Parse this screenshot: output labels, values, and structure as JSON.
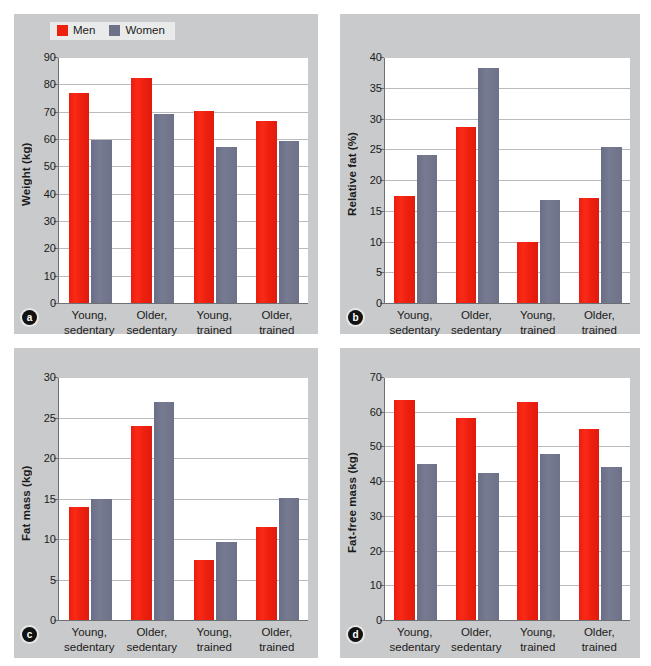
{
  "figure": {
    "background": "#ffffff",
    "panel_background": "#c9cacb",
    "plot_background": "#ffffff"
  },
  "legend": {
    "entries": [
      {
        "label": "Men",
        "color": "#ee2010",
        "swatch_name": "men-color-swatch"
      },
      {
        "label": "Women",
        "color": "#6d7289",
        "swatch_name": "women-color-swatch"
      }
    ]
  },
  "categories": [
    "Young,\nsedentary",
    "Older,\nsedentary",
    "Young,\ntrained",
    "Older,\ntrained"
  ],
  "panels": [
    {
      "tag": "a",
      "ylabel": "Weight (kg)",
      "ticks": [
        "0",
        "10",
        "20",
        "30",
        "40",
        "50",
        "60",
        "70",
        "80",
        "90"
      ]
    },
    {
      "tag": "b",
      "ylabel": "Relative fat (%)",
      "ticks": [
        "0",
        "5",
        "10",
        "15",
        "20",
        "25",
        "30",
        "35",
        "40"
      ]
    },
    {
      "tag": "c",
      "ylabel": "Fat mass (kg)",
      "ticks": [
        "0",
        "5",
        "10",
        "15",
        "20",
        "25",
        "30"
      ]
    },
    {
      "tag": "d",
      "ylabel": "Fat-free mass (kg)",
      "ticks": [
        "0",
        "10",
        "20",
        "30",
        "40",
        "50",
        "60",
        "70"
      ]
    }
  ],
  "chart_data": [
    {
      "panel": "a",
      "type": "bar",
      "title": "",
      "xlabel": "",
      "ylabel": "Weight (kg)",
      "ylim": [
        0,
        90
      ],
      "ytick_step": 10,
      "grid": true,
      "legend_position": "top-left",
      "categories": [
        "Young, sedentary",
        "Older, sedentary",
        "Young, trained",
        "Older, trained"
      ],
      "series": [
        {
          "name": "Men",
          "color": "#ee2010",
          "values": [
            77.0,
            82.5,
            70.2,
            66.5
          ]
        },
        {
          "name": "Women",
          "color": "#6d7289",
          "values": [
            59.8,
            69.2,
            57.0,
            59.1
          ]
        }
      ]
    },
    {
      "panel": "b",
      "type": "bar",
      "title": "",
      "xlabel": "",
      "ylabel": "Relative fat (%)",
      "ylim": [
        0,
        40
      ],
      "ytick_step": 5,
      "grid": true,
      "legend_position": "none",
      "categories": [
        "Young, sedentary",
        "Older, sedentary",
        "Young, trained",
        "Older, trained"
      ],
      "series": [
        {
          "name": "Men",
          "color": "#ee2010",
          "values": [
            17.4,
            28.6,
            10.0,
            17.1
          ]
        },
        {
          "name": "Women",
          "color": "#6d7289",
          "values": [
            24.0,
            38.2,
            16.8,
            25.4
          ]
        }
      ]
    },
    {
      "panel": "c",
      "type": "bar",
      "title": "",
      "xlabel": "",
      "ylabel": "Fat mass (kg)",
      "ylim": [
        0,
        30
      ],
      "ytick_step": 5,
      "grid": true,
      "legend_position": "none",
      "categories": [
        "Young, sedentary",
        "Older, sedentary",
        "Young, trained",
        "Older, trained"
      ],
      "series": [
        {
          "name": "Men",
          "color": "#ee2010",
          "values": [
            13.9,
            23.9,
            7.4,
            11.5
          ]
        },
        {
          "name": "Women",
          "color": "#6d7289",
          "values": [
            14.9,
            26.9,
            9.6,
            15.1
          ]
        }
      ]
    },
    {
      "panel": "d",
      "type": "bar",
      "title": "",
      "xlabel": "",
      "ylabel": "Fat-free mass (kg)",
      "ylim": [
        0,
        70
      ],
      "ytick_step": 10,
      "grid": true,
      "legend_position": "none",
      "categories": [
        "Young, sedentary",
        "Older, sedentary",
        "Young, trained",
        "Older, trained"
      ],
      "series": [
        {
          "name": "Men",
          "color": "#ee2010",
          "values": [
            63.3,
            58.3,
            62.8,
            55.0
          ]
        },
        {
          "name": "Women",
          "color": "#6d7289",
          "values": [
            45.0,
            42.3,
            47.7,
            44.0
          ]
        }
      ]
    }
  ]
}
